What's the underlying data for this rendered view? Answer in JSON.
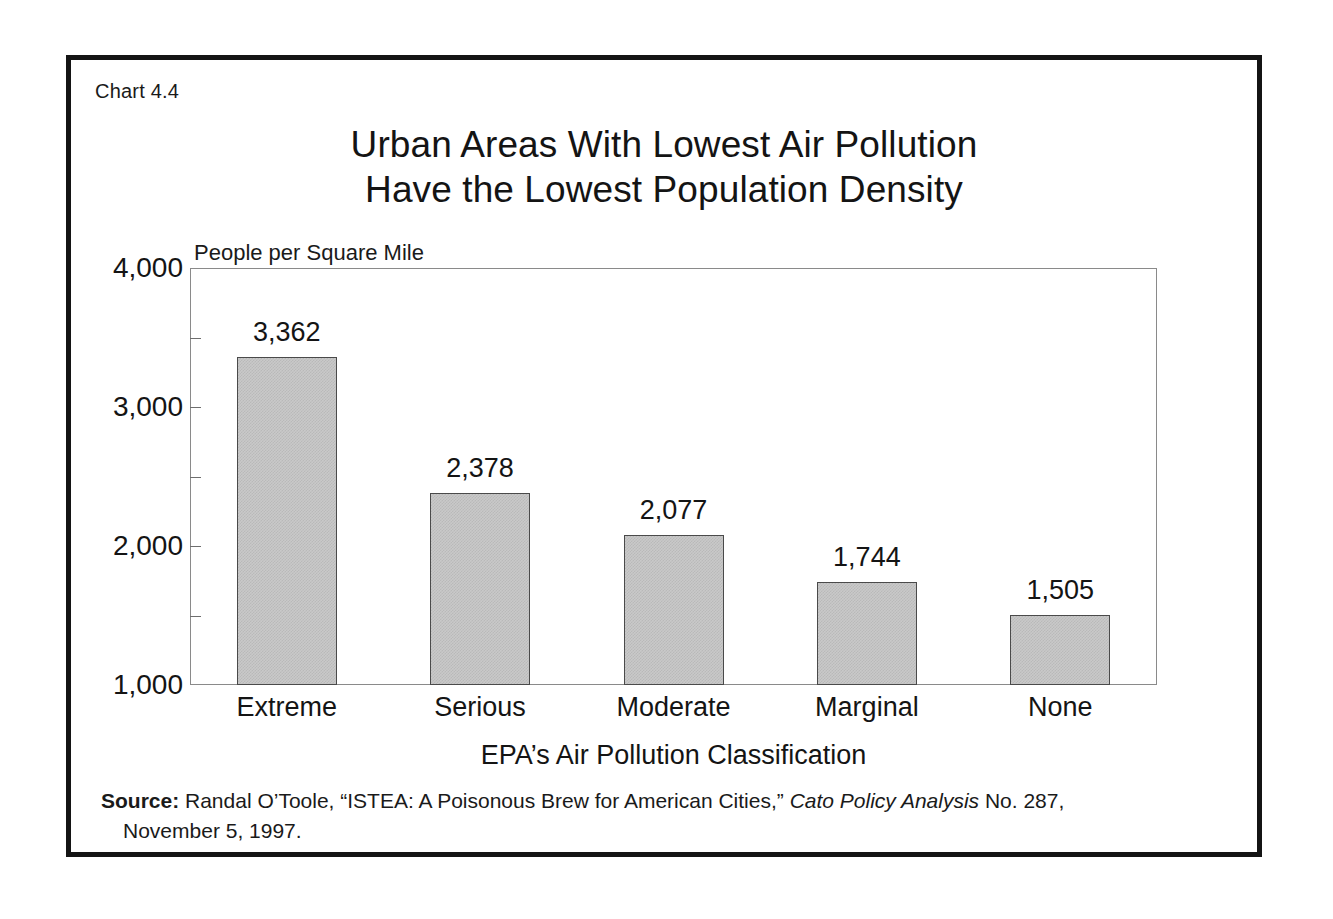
{
  "figure": {
    "chart_number": "Chart 4.4",
    "title_line1": "Urban Areas With Lowest Air Pollution",
    "title_line2": "Have the Lowest Population Density"
  },
  "source": {
    "label": "Source:",
    "text_before_italic": " Randal O’Toole, “ISTEA: A Poisonous Brew for American Cities,” ",
    "italic_title": "Cato Policy Analysis",
    "text_after_italic": " No. 287,",
    "line2": "November 5, 1997."
  },
  "chart_data": {
    "type": "bar",
    "title": "Urban Areas With Lowest Air Pollution Have the Lowest Population Density",
    "xlabel": "EPA’s Air Pollution Classification",
    "ylabel": "People per Square Mile",
    "categories": [
      "Extreme",
      "Serious",
      "Moderate",
      "Marginal",
      "None"
    ],
    "values": [
      3362,
      2378,
      2077,
      1744,
      1505
    ],
    "value_labels": [
      "3,362",
      "2,378",
      "2,077",
      "1,744",
      "1,505"
    ],
    "ylim": [
      1000,
      4000
    ],
    "ytick_labels": [
      "4,000",
      "3,000",
      "2,000",
      "1,000"
    ],
    "ytick_values": [
      4000,
      3000,
      2000,
      1000
    ],
    "minor_tick_values": [
      3500,
      2500,
      1500
    ],
    "grid": false,
    "legend": "none",
    "bar_fill_color": "#c9c9c9",
    "bar_edge_color": "#4a4a4a",
    "axis_color": "#8a8a8a",
    "frame_color": "#141414"
  }
}
